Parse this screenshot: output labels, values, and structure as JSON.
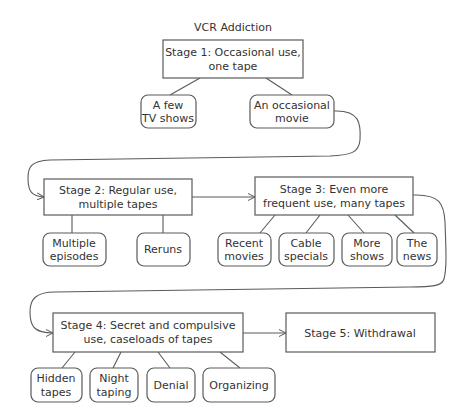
{
  "title": "VCR Addiction",
  "stages": [
    {
      "id": "stage1",
      "lines": [
        "Stage 1: Occasional use,",
        "one tape"
      ]
    },
    {
      "id": "stage2",
      "lines": [
        "Stage 2: Regular use,",
        "multiple tapes"
      ]
    },
    {
      "id": "stage3",
      "lines": [
        "Stage 3: Even more",
        "frequent use, many tapes"
      ]
    },
    {
      "id": "stage4",
      "lines": [
        "Stage 4: Secret and compulsive",
        "use, caseloads of tapes"
      ]
    },
    {
      "id": "stage5",
      "lines": [
        "Stage 5: Withdrawal"
      ]
    }
  ],
  "leaves": {
    "stage1": [
      {
        "lines": [
          "A few",
          "TV shows"
        ]
      },
      {
        "lines": [
          "An occasional",
          "movie"
        ]
      }
    ],
    "stage2": [
      {
        "lines": [
          "Multiple",
          "episodes"
        ]
      },
      {
        "lines": [
          "Reruns"
        ]
      }
    ],
    "stage3": [
      {
        "lines": [
          "Recent",
          "movies"
        ]
      },
      {
        "lines": [
          "Cable",
          "specials"
        ]
      },
      {
        "lines": [
          "More",
          "shows"
        ]
      },
      {
        "lines": [
          "The",
          "news"
        ]
      }
    ],
    "stage4": [
      {
        "lines": [
          "Hidden",
          "tapes"
        ]
      },
      {
        "lines": [
          "Night",
          "taping"
        ]
      },
      {
        "lines": [
          "Denial"
        ]
      },
      {
        "lines": [
          "Organizing"
        ]
      }
    ]
  },
  "colors": {
    "stroke": "#5a5a5a",
    "text": "#333333",
    "background": "#ffffff"
  }
}
